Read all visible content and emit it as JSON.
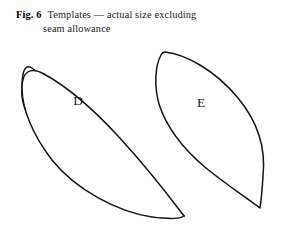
{
  "figure": {
    "label": "Fig. 6",
    "caption_line_1": "Templates — actual size excluding",
    "caption_line_2": "seam allowance",
    "caption_full": "Fig. 6 Templates — actual size excluding seam allowance"
  },
  "shapes": [
    {
      "id": "template-d",
      "letter": "D",
      "description": "teardrop petal template"
    },
    {
      "id": "template-e",
      "letter": "E",
      "description": "leaf lens template"
    }
  ],
  "colors": {
    "background": "#ffffff",
    "outline": "#141414",
    "text": "#1a1a1a"
  }
}
